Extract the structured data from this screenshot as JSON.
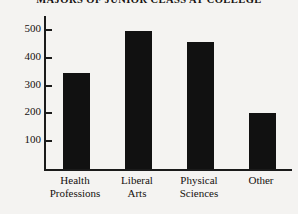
{
  "chart_data": {
    "type": "bar",
    "title": "MAJORS OF JUNIOR CLASS AT COLLEGE",
    "xlabel": "",
    "ylabel": "",
    "categories": [
      "Health Professions",
      "Liberal Arts",
      "Physical Sciences",
      "Other"
    ],
    "category_lines": [
      [
        "Health",
        "Professions"
      ],
      [
        "Liberal",
        "Arts"
      ],
      [
        "Physical",
        "Sciences"
      ],
      [
        "Other",
        ""
      ]
    ],
    "values": [
      345,
      495,
      455,
      200
    ],
    "ylim": [
      0,
      550
    ],
    "yticks": [
      100,
      200,
      300,
      400,
      500
    ],
    "ytick_labels": [
      "100",
      "200",
      "300",
      "400",
      "500"
    ],
    "grid": false,
    "legend": false,
    "bar_color": "#111111",
    "axis_color": "#1a1a1a",
    "background_color": "#f4f3f1"
  }
}
